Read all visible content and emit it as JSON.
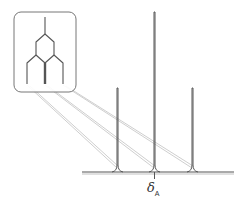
{
  "figure": {
    "type": "nmr-splitting-diagram",
    "chemical_shift_label": "δ",
    "chemical_shift_subscript": "A",
    "peaks": [
      {
        "position": "left",
        "relative_intensity": 1
      },
      {
        "position": "center",
        "relative_intensity": 2
      },
      {
        "position": "right",
        "relative_intensity": 1
      }
    ],
    "colors": {
      "line": "#555555",
      "connector": "#c8c8c8",
      "box_border": "#777777",
      "box_fill": "#ffffff"
    }
  }
}
